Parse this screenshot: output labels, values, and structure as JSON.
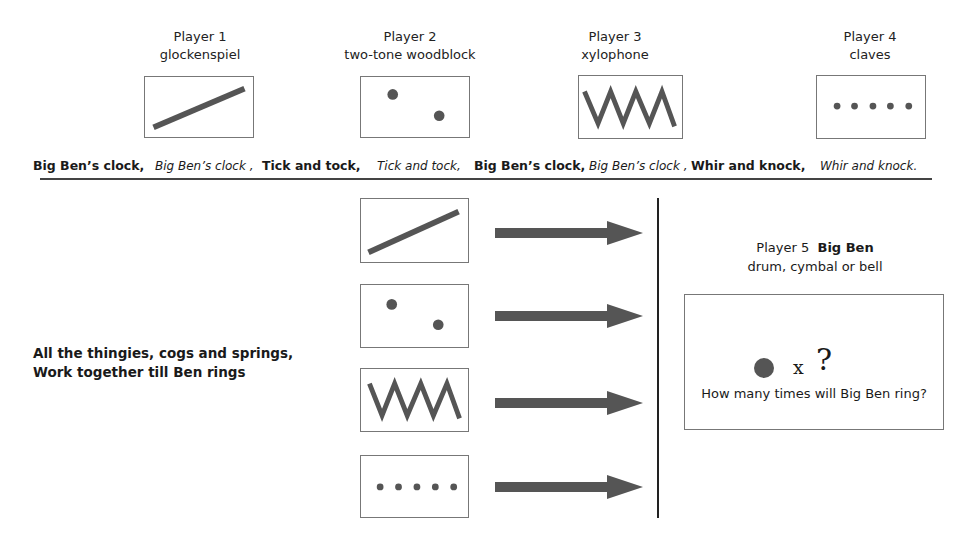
{
  "players": [
    {
      "label": "Player 1",
      "instrument": "glockenspiel",
      "symbol": "diagonal-line"
    },
    {
      "label": "Player 2",
      "instrument": "two-tone woodblock",
      "symbol": "two-dots"
    },
    {
      "label": "Player 3",
      "instrument": "xylophone",
      "symbol": "zigzag"
    },
    {
      "label": "Player 4",
      "instrument": "claves",
      "symbol": "five-dots"
    }
  ],
  "lyrics": [
    {
      "text": "Big Ben’s clock,",
      "style": "bold"
    },
    {
      "text": "Big Ben’s clock ,",
      "style": "italic"
    },
    {
      "text": "Tick and tock,",
      "style": "bold"
    },
    {
      "text": "Tick and tock,",
      "style": "italic"
    },
    {
      "text": "Big Ben’s clock,",
      "style": "bold"
    },
    {
      "text": "Big Ben’s clock ,",
      "style": "italic"
    },
    {
      "text": "Whir and knock,",
      "style": "bold"
    },
    {
      "text": "Whir and knock.",
      "style": "italic"
    }
  ],
  "chant": {
    "line1": "All the thingies, cogs and springs,",
    "line2": "Work together till Ben rings"
  },
  "player5": {
    "label": "Player 5",
    "name": "Big Ben",
    "instrument": "drum, cymbal or bell",
    "times_symbol": "x",
    "unknown_symbol": "?",
    "question": "How many times will Big Ben ring?"
  },
  "colors": {
    "symbol": "#555555",
    "border": "#777777",
    "rule": "#444444"
  }
}
